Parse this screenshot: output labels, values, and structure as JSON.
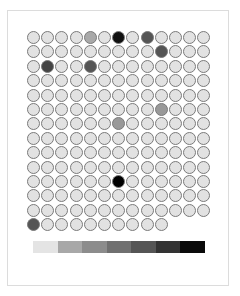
{
  "title": "",
  "grid": {
    "columns": 14,
    "rows": 13,
    "default_color": "#e2e2e2",
    "cells": [
      "#e2e2e2",
      "#e2e2e2",
      "#e2e2e2",
      "#e2e2e2",
      "#a9a9a9",
      "#e2e2e2",
      "#111111",
      "#e2e2e2",
      "#555555",
      "#e2e2e2",
      "#e2e2e2",
      "#e2e2e2",
      "#e2e2e2",
      "#e2e2e2",
      "#e2e2e2",
      "#e2e2e2",
      "#e2e2e2",
      "#e2e2e2",
      "#e2e2e2",
      "#e2e2e2",
      "#e2e2e2",
      "#e2e2e2",
      "#555555",
      "#e2e2e2",
      "#e2e2e2",
      "#e2e2e2",
      "#e2e2e2",
      "#444444",
      "#e2e2e2",
      "#e2e2e2",
      "#555555",
      "#e2e2e2",
      "#e2e2e2",
      "#e2e2e2",
      "#e2e2e2",
      "#e2e2e2",
      "#e2e2e2",
      "#e2e2e2",
      "#e2e2e2",
      "#e2e2e2",
      "#e2e2e2",
      "#e2e2e2",
      "#e2e2e2",
      "#e2e2e2",
      "#e2e2e2",
      "#e2e2e2",
      "#e2e2e2",
      "#e2e2e2",
      "#e2e2e2",
      "#e2e2e2",
      "#e2e2e2",
      "#e2e2e2",
      "#e2e2e2",
      "#e2e2e2",
      "#e2e2e2",
      "#e2e2e2",
      "#e2e2e2",
      "#e2e2e2",
      "#e2e2e2",
      "#e2e2e2",
      "#e2e2e2",
      "#e2e2e2",
      "#e2e2e2",
      "#e2e2e2",
      "#e2e2e2",
      "#e2e2e2",
      "#e2e2e2",
      "#e2e2e2",
      "#e2e2e2",
      "#e2e2e2",
      "#e2e2e2",
      "#e2e2e2",
      "#e2e2e2",
      "#e2e2e2",
      "#999999",
      "#e2e2e2",
      "#e2e2e2",
      "#e2e2e2",
      "#e2e2e2",
      "#e2e2e2",
      "#e2e2e2",
      "#e2e2e2",
      "#e2e2e2",
      "#e2e2e2",
      "#999999",
      "#e2e2e2",
      "#e2e2e2",
      "#e2e2e2",
      "#e2e2e2",
      "#e2e2e2",
      "#e2e2e2",
      "#e2e2e2",
      "#e2e2e2",
      "#e2e2e2",
      "#e2e2e2",
      "#e2e2e2",
      "#e2e2e2",
      "#e2e2e2",
      "#e2e2e2",
      "#e2e2e2",
      "#e2e2e2",
      "#e2e2e2",
      "#e2e2e2",
      "#e2e2e2",
      "#e2e2e2",
      "#e2e2e2",
      "#e2e2e2",
      "#e2e2e2",
      "#e2e2e2",
      "#e2e2e2",
      "#e2e2e2",
      "#e2e2e2",
      "#e2e2e2",
      "#e2e2e2",
      "#e2e2e2",
      "#e2e2e2",
      "#e2e2e2",
      "#e2e2e2",
      "#e2e2e2",
      "#e2e2e2",
      "#e2e2e2",
      "#e2e2e2",
      "#e2e2e2",
      "#e2e2e2",
      "#e2e2e2",
      "#e2e2e2",
      "#e2e2e2",
      "#e2e2e2",
      "#e2e2e2",
      "#e2e2e2",
      "#e2e2e2",
      "#e2e2e2",
      "#e2e2e2",
      "#e2e2e2",
      "#e2e2e2",
      "#e2e2e2",
      "#000000",
      "#e2e2e2",
      "#e2e2e2",
      "#e2e2e2",
      "#e2e2e2",
      "#e2e2e2",
      "#e2e2e2",
      "#e2e2e2",
      "#e2e2e2",
      "#e2e2e2",
      "#e2e2e2",
      "#e2e2e2",
      "#e2e2e2",
      "#e2e2e2",
      "#e2e2e2",
      "#e2e2e2",
      "#e2e2e2",
      "#e2e2e2",
      "#e2e2e2",
      "#e2e2e2",
      "#e2e2e2",
      "#e2e2e2",
      "#e2e2e2",
      "#e2e2e2",
      "#e2e2e2",
      "#e2e2e2",
      "#e2e2e2",
      "#e2e2e2",
      "#e2e2e2",
      "#e2e2e2",
      "#e2e2e2",
      "#e2e2e2",
      "#e2e2e2",
      "#555555",
      "#e2e2e2",
      "#e2e2e2",
      "#e2e2e2",
      "#e2e2e2",
      "#e2e2e2",
      "#e2e2e2",
      "#e2e2e2",
      "#e2e2e2",
      "#e2e2e2"
    ]
  },
  "legend": {
    "swatches": [
      "#e4e4e4",
      "#a8a8a8",
      "#8c8c8c",
      "#707070",
      "#555555",
      "#333333",
      "#0a0a0a"
    ]
  }
}
